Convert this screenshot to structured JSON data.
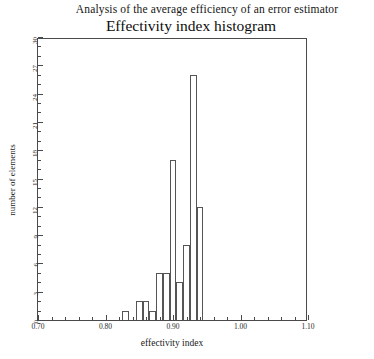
{
  "figure": {
    "suptitle": "Analysis of the average efficiency of an error estimator",
    "title": "Effectivity index histogram"
  },
  "chart_data": {
    "type": "bar",
    "title": "Effectivity index histogram",
    "subtitle": "Analysis of the average efficiency of an error estimator",
    "xlabel": "effectivity index",
    "ylabel": "number of elements",
    "xlim": [
      0.7,
      1.1
    ],
    "ylim": [
      0,
      30
    ],
    "grid": false,
    "legend": null,
    "bin_width": 0.01,
    "categories": [
      "0.825",
      "0.835",
      "0.845",
      "0.855",
      "0.865",
      "0.875",
      "0.885",
      "0.895",
      "0.905",
      "0.915",
      "0.925",
      "0.935"
    ],
    "bin_edges": [
      0.825,
      0.835,
      0.845,
      0.855,
      0.865,
      0.875,
      0.885,
      0.895,
      0.905,
      0.915,
      0.925,
      0.935,
      0.945
    ],
    "values": [
      1,
      0,
      2,
      2,
      1,
      5,
      5,
      17,
      4,
      8,
      26,
      12
    ],
    "x_ticks": [
      {
        "value": 0.7,
        "label": "0.70",
        "major": true
      },
      {
        "value": 0.72,
        "label": "",
        "major": false
      },
      {
        "value": 0.74,
        "label": "",
        "major": false
      },
      {
        "value": 0.76,
        "label": "",
        "major": false
      },
      {
        "value": 0.78,
        "label": "",
        "major": false
      },
      {
        "value": 0.8,
        "label": "0.80",
        "major": true
      },
      {
        "value": 0.82,
        "label": "",
        "major": false
      },
      {
        "value": 0.84,
        "label": "",
        "major": false
      },
      {
        "value": 0.86,
        "label": "",
        "major": false
      },
      {
        "value": 0.88,
        "label": "",
        "major": false
      },
      {
        "value": 0.9,
        "label": "0.90",
        "major": true
      },
      {
        "value": 0.92,
        "label": "",
        "major": false
      },
      {
        "value": 0.94,
        "label": "",
        "major": false
      },
      {
        "value": 0.96,
        "label": "",
        "major": false
      },
      {
        "value": 0.98,
        "label": "",
        "major": false
      },
      {
        "value": 1.0,
        "label": "1.00",
        "major": true
      },
      {
        "value": 1.02,
        "label": "",
        "major": false
      },
      {
        "value": 1.04,
        "label": "",
        "major": false
      },
      {
        "value": 1.06,
        "label": "",
        "major": false
      },
      {
        "value": 1.08,
        "label": "",
        "major": false
      },
      {
        "value": 1.1,
        "label": "1.10",
        "major": true
      }
    ],
    "y_ticks": [
      {
        "value": 0,
        "label": "0",
        "major": true
      },
      {
        "value": 1,
        "label": "",
        "major": false
      },
      {
        "value": 2,
        "label": "",
        "major": false
      },
      {
        "value": 3,
        "label": "3",
        "major": true
      },
      {
        "value": 4,
        "label": "",
        "major": false
      },
      {
        "value": 5,
        "label": "",
        "major": false
      },
      {
        "value": 6,
        "label": "6",
        "major": true
      },
      {
        "value": 7,
        "label": "",
        "major": false
      },
      {
        "value": 8,
        "label": "",
        "major": false
      },
      {
        "value": 9,
        "label": "9",
        "major": true
      },
      {
        "value": 10,
        "label": "",
        "major": false
      },
      {
        "value": 11,
        "label": "",
        "major": false
      },
      {
        "value": 12,
        "label": "12",
        "major": true
      },
      {
        "value": 13,
        "label": "",
        "major": false
      },
      {
        "value": 14,
        "label": "",
        "major": false
      },
      {
        "value": 15,
        "label": "15",
        "major": true
      },
      {
        "value": 16,
        "label": "",
        "major": false
      },
      {
        "value": 17,
        "label": "",
        "major": false
      },
      {
        "value": 18,
        "label": "18",
        "major": true
      },
      {
        "value": 19,
        "label": "",
        "major": false
      },
      {
        "value": 20,
        "label": "",
        "major": false
      },
      {
        "value": 21,
        "label": "21",
        "major": true
      },
      {
        "value": 22,
        "label": "",
        "major": false
      },
      {
        "value": 23,
        "label": "",
        "major": false
      },
      {
        "value": 24,
        "label": "24",
        "major": true
      },
      {
        "value": 25,
        "label": "",
        "major": false
      },
      {
        "value": 26,
        "label": "",
        "major": false
      },
      {
        "value": 27,
        "label": "27",
        "major": true
      },
      {
        "value": 28,
        "label": "",
        "major": false
      },
      {
        "value": 29,
        "label": "",
        "major": false
      },
      {
        "value": 30,
        "label": "30",
        "major": true
      }
    ],
    "colors": {
      "bar_edge": "#555555",
      "bar_face": "#ffffff",
      "axis": "#4a4a4a",
      "text": "#1a1a1a",
      "background": "#ffffff"
    }
  }
}
